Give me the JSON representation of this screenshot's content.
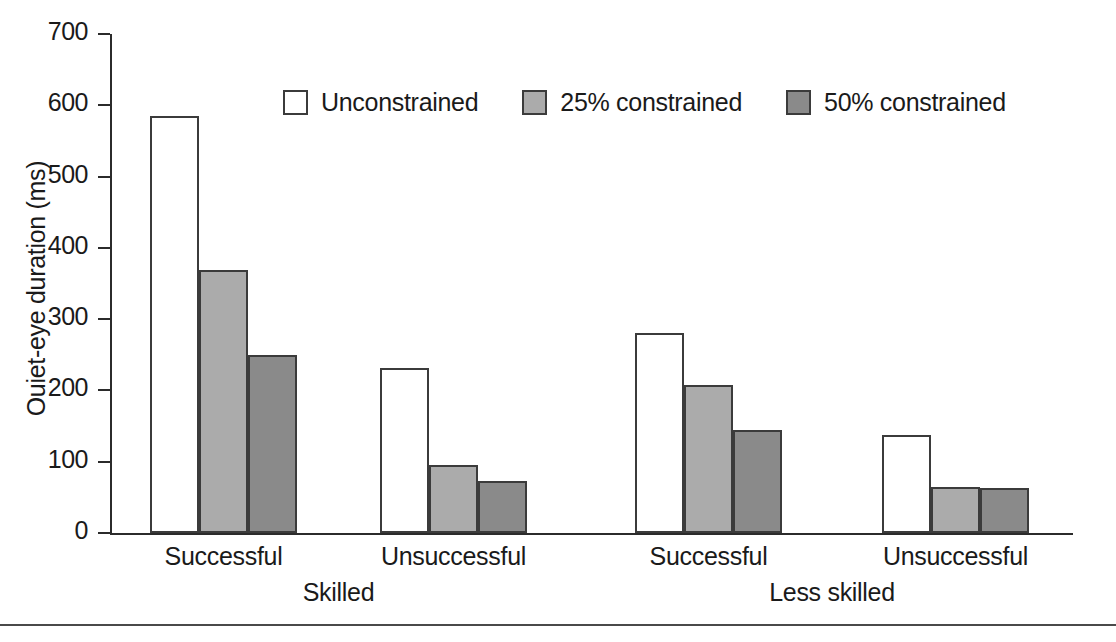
{
  "chart_data": {
    "type": "bar",
    "title": "",
    "subtitle": "",
    "xlabel": "",
    "ylabel": "Ouiet-eye duration (ms)",
    "ylim": [
      0,
      700
    ],
    "yticks": [
      0,
      100,
      200,
      300,
      400,
      500,
      600,
      700
    ],
    "ytick_labels": [
      "0",
      "100",
      "200",
      "300",
      "400",
      "500",
      "600",
      "700"
    ],
    "grid": false,
    "legend_position": "top-center",
    "categories": [
      "Successful",
      "Unsuccessful",
      "Successful",
      "Unsuccessful"
    ],
    "groups": [
      {
        "label": "Skilled",
        "categories": [
          "Successful",
          "Unsuccessful"
        ]
      },
      {
        "label": "Less skilled",
        "categories": [
          "Successful",
          "Unsuccessful"
        ]
      }
    ],
    "series": [
      {
        "name": "Unconstrained",
        "color": "#ffffff",
        "values": [
          585,
          232,
          280,
          138
        ]
      },
      {
        "name": "25% constrained",
        "color": "#ababab",
        "values": [
          369,
          96,
          207,
          64
        ]
      },
      {
        "name": "50% constrained",
        "color": "#8a8a8a",
        "values": [
          249,
          73,
          145,
          63
        ]
      }
    ]
  },
  "legend": {
    "items": [
      {
        "label": "Unconstrained"
      },
      {
        "label": "25% constrained"
      },
      {
        "label": "50% constrained"
      }
    ]
  },
  "axis": {
    "y_title": "Ouiet-eye duration (ms)",
    "ticks": [
      "700",
      "600",
      "500",
      "400",
      "300",
      "200",
      "100",
      "0"
    ]
  },
  "x_axis": {
    "category_labels": [
      "Successful",
      "Unsuccessful",
      "Successful",
      "Unsuccessful"
    ],
    "group_labels": [
      "Skilled",
      "Less skilled"
    ]
  },
  "colors": {
    "axis": "#2b2b2b",
    "bar_border": "#3b3b3b",
    "series_unconstrained": "#ffffff",
    "series_25": "#ababab",
    "series_50": "#8a8a8a",
    "background": "#ffffff"
  }
}
